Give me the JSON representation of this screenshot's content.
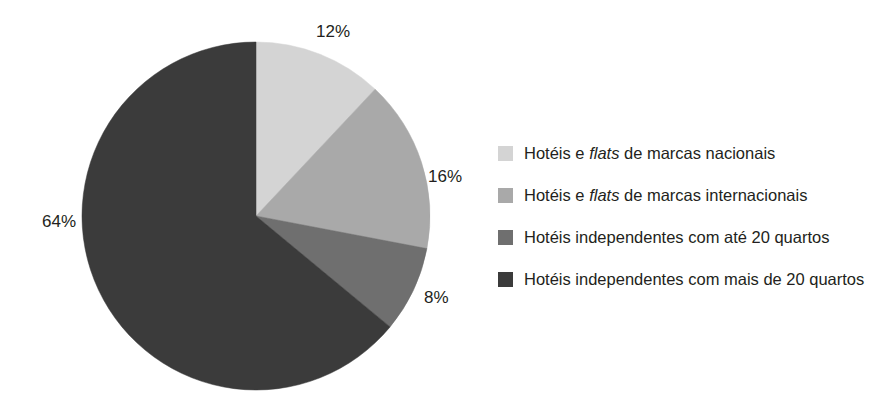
{
  "chart_data": {
    "type": "pie",
    "title": "",
    "subtitle": "",
    "xlabel": "",
    "ylabel": "",
    "grid": false,
    "legend_position": "right",
    "start_angle_deg": 0,
    "direction": "clockwise",
    "unit": "%",
    "categories": [
      "Hotéis e flats de marcas nacionais",
      "Hotéis e flats de marcas internacionais",
      "Hotéis independentes com até 20 quartos",
      "Hotéis independentes com mais de 20 quartos"
    ],
    "values": [
      12,
      16,
      8,
      64
    ],
    "data_labels": [
      "12%",
      "16%",
      "8%",
      "64%"
    ],
    "colors": [
      "#d4d4d4",
      "#a9a9a9",
      "#6f6f6f",
      "#3b3b3b"
    ],
    "slices": [
      {
        "label": "Hotéis e flats de marcas nacionais",
        "value": 12,
        "data_label": "12%",
        "color": "#d4d4d4"
      },
      {
        "label": "Hotéis e flats de marcas internacionais",
        "value": 16,
        "data_label": "16%",
        "color": "#a9a9a9"
      },
      {
        "label": "Hotéis independentes com até 20 quartos",
        "value": 8,
        "data_label": "8%",
        "color": "#6f6f6f"
      },
      {
        "label": "Hotéis independentes com mais de 20 quartos",
        "value": 64,
        "data_label": "64%",
        "color": "#3b3b3b"
      }
    ]
  },
  "legend": {
    "items": [
      {
        "swatch_name": "legend-swatch-marcas-nacionais",
        "text_prefix": "Hotéis e ",
        "emphasis": "flats",
        "text_suffix": " de marcas nacionais",
        "color": "#d4d4d4"
      },
      {
        "swatch_name": "legend-swatch-marcas-internacionais",
        "text_prefix": "Hotéis e ",
        "emphasis": "flats",
        "text_suffix": " de marcas internacionais",
        "color": "#a9a9a9"
      },
      {
        "swatch_name": "legend-swatch-ate-20-quartos",
        "text_prefix": "Hotéis independentes com até 20 quartos",
        "emphasis": "",
        "text_suffix": "",
        "color": "#6f6f6f"
      },
      {
        "swatch_name": "legend-swatch-mais-de-20-quartos",
        "text_prefix": "Hotéis independentes com mais de 20 quartos",
        "emphasis": "",
        "text_suffix": "",
        "color": "#3b3b3b"
      }
    ]
  },
  "geometry": {
    "center_x": 256,
    "center_y": 216,
    "radius": 174
  }
}
